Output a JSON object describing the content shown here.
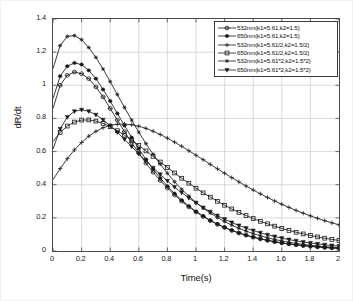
{
  "chart_data": {
    "type": "line",
    "title": "",
    "xlabel": "Time(s)",
    "ylabel": "dR/dt",
    "xlim": [
      0,
      2
    ],
    "ylim": [
      0,
      1.4
    ],
    "grid": true,
    "legend_position": "upper right",
    "xticks": [
      "0",
      "0.2",
      "0.4",
      "0.6",
      "0.8",
      "1",
      "1.2",
      "1.4",
      "1.6",
      "1.8",
      "2"
    ],
    "xtick_values": [
      0,
      0.2,
      0.4,
      0.6,
      0.8,
      1.0,
      1.2,
      1.4,
      1.6,
      1.8,
      2.0
    ],
    "yticks": [
      "0",
      "0.2",
      "0.4",
      "0.6",
      "0.8",
      "1",
      "1.2",
      "1.4"
    ],
    "ytick_values": [
      0,
      0.2,
      0.4,
      0.6,
      0.8,
      1.0,
      1.2,
      1.4
    ],
    "x": [
      0,
      0.05,
      0.1,
      0.15,
      0.2,
      0.25,
      0.3,
      0.35,
      0.4,
      0.45,
      0.5,
      0.55,
      0.6,
      0.65,
      0.7,
      0.75,
      0.8,
      0.85,
      0.9,
      0.95,
      1.0,
      1.05,
      1.1,
      1.15,
      1.2,
      1.25,
      1.3,
      1.35,
      1.4,
      1.45,
      1.5,
      1.55,
      1.6,
      1.65,
      1.7,
      1.75,
      1.8,
      1.85,
      1.9,
      1.95,
      2.0
    ],
    "series": [
      {
        "name": "532nm(k1=5.61,k2=1.5)",
        "marker": "hexagram-open",
        "values": [
          0.86,
          1.0,
          1.06,
          1.08,
          1.07,
          1.04,
          0.99,
          0.93,
          0.86,
          0.79,
          0.72,
          0.655,
          0.59,
          0.53,
          0.475,
          0.425,
          0.38,
          0.338,
          0.3,
          0.266,
          0.235,
          0.208,
          0.183,
          0.161,
          0.142,
          0.124,
          0.109,
          0.0955,
          0.0838,
          0.0734,
          0.0643,
          0.0562,
          0.0492,
          0.043,
          0.0375,
          0.0327,
          0.0285,
          0.0248,
          0.0215,
          0.0187,
          0.0162
        ]
      },
      {
        "name": "650nm(k1=5.61,k2=1.5)",
        "marker": "star-filled",
        "values": [
          0.92,
          1.055,
          1.115,
          1.135,
          1.125,
          1.09,
          1.04,
          0.975,
          0.905,
          0.83,
          0.757,
          0.685,
          0.617,
          0.553,
          0.494,
          0.44,
          0.391,
          0.347,
          0.307,
          0.271,
          0.239,
          0.211,
          0.185,
          0.163,
          0.143,
          0.125,
          0.109,
          0.0955,
          0.0835,
          0.073,
          0.0637,
          0.0556,
          0.0485,
          0.0423,
          0.0368,
          0.032,
          0.0278,
          0.0242,
          0.021,
          0.0182,
          0.0158
        ]
      },
      {
        "name": "532nm(k1=5.61/2,k2=1.5/2)",
        "marker": "plus",
        "values": [
          0.43,
          0.497,
          0.557,
          0.61,
          0.655,
          0.693,
          0.722,
          0.744,
          0.758,
          0.765,
          0.766,
          0.762,
          0.753,
          0.74,
          0.723,
          0.703,
          0.681,
          0.657,
          0.632,
          0.605,
          0.578,
          0.551,
          0.523,
          0.496,
          0.469,
          0.443,
          0.417,
          0.392,
          0.368,
          0.345,
          0.323,
          0.302,
          0.282,
          0.263,
          0.245,
          0.228,
          0.212,
          0.197,
          0.183,
          0.17,
          0.158
        ]
      },
      {
        "name": "650nm(k1=5.61/2,k2=1.5/2)",
        "marker": "square-open",
        "values": [
          0.66,
          0.716,
          0.754,
          0.778,
          0.79,
          0.791,
          0.784,
          0.77,
          0.75,
          0.726,
          0.699,
          0.669,
          0.637,
          0.604,
          0.571,
          0.537,
          0.504,
          0.471,
          0.439,
          0.409,
          0.379,
          0.351,
          0.325,
          0.3,
          0.276,
          0.254,
          0.233,
          0.214,
          0.196,
          0.179,
          0.164,
          0.15,
          0.136,
          0.124,
          0.113,
          0.103,
          0.0936,
          0.085,
          0.0772,
          0.07,
          0.0635
        ]
      },
      {
        "name": "532nm(k1=5.61*2,k2=1.5*2)",
        "marker": "asterisk",
        "values": [
          1.1,
          1.24,
          1.295,
          1.3,
          1.275,
          1.228,
          1.168,
          1.098,
          1.022,
          0.944,
          0.866,
          0.79,
          0.717,
          0.648,
          0.584,
          0.524,
          0.469,
          0.418,
          0.372,
          0.331,
          0.293,
          0.259,
          0.229,
          0.202,
          0.178,
          0.156,
          0.137,
          0.12,
          0.105,
          0.0918,
          0.08,
          0.0697,
          0.0607,
          0.0528,
          0.0459,
          0.0398,
          0.0345,
          0.0299,
          0.0259,
          0.0224,
          0.0194
        ]
      },
      {
        "name": "650nm(k1=5.61*2,k2=1.5*2)",
        "marker": "triangle-down-filled",
        "values": [
          0.615,
          0.737,
          0.808,
          0.843,
          0.852,
          0.843,
          0.822,
          0.792,
          0.756,
          0.716,
          0.674,
          0.63,
          0.587,
          0.544,
          0.502,
          0.462,
          0.423,
          0.386,
          0.352,
          0.32,
          0.29,
          0.262,
          0.237,
          0.213,
          0.192,
          0.172,
          0.154,
          0.138,
          0.123,
          0.11,
          0.0977,
          0.0871,
          0.0775,
          0.0689,
          0.0612,
          0.0543,
          0.0481,
          0.0426,
          0.0377,
          0.0333,
          0.0294
        ]
      }
    ]
  },
  "axes": {
    "x_title": "Time(s)",
    "y_title": "dR/dt"
  },
  "colors": {
    "line": "#1a1a1a",
    "grid": "#cccccc",
    "axis": "#4a4a4a",
    "background": "#ffffff"
  }
}
